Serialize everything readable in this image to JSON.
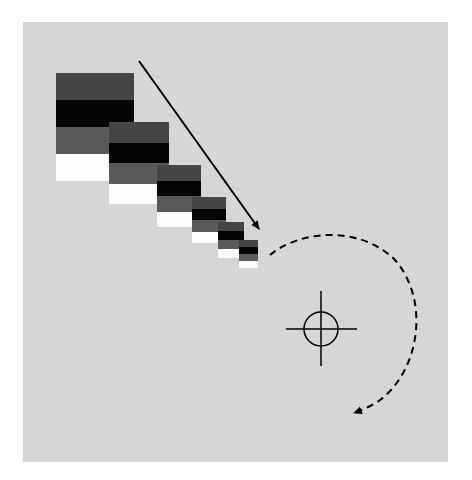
{
  "diagram": {
    "background": {
      "x": 23,
      "y": 22,
      "w": 425,
      "h": 440,
      "color": "#d6d6d6"
    },
    "band_colors": [
      "#454545",
      "#050505",
      "#5a5a5a",
      "#fdfdfd"
    ],
    "swatch_blocks": [
      {
        "x": 56,
        "y": 73,
        "w": 78,
        "h": 108
      },
      {
        "x": 109,
        "y": 122,
        "w": 60,
        "h": 82
      },
      {
        "x": 157,
        "y": 165,
        "w": 44,
        "h": 62
      },
      {
        "x": 192,
        "y": 197,
        "w": 34,
        "h": 46
      },
      {
        "x": 218,
        "y": 222,
        "w": 26,
        "h": 36
      },
      {
        "x": 239,
        "y": 240,
        "w": 19,
        "h": 28
      }
    ],
    "straight_arrow": {
      "x1": 139,
      "y1": 61,
      "x2": 259,
      "y2": 229,
      "color": "#000000"
    },
    "dashed_arc_arrow": {
      "path": "M 270 255 C 300 230, 360 225, 395 260 C 430 300, 420 370, 380 400 C 372 406, 362 410, 354 413",
      "tip": {
        "x": 352,
        "y": 413
      },
      "color": "#000000"
    },
    "crosshair": {
      "cx": 321,
      "cy": 329,
      "r": 17,
      "h_from": 286,
      "h_to": 357,
      "v_from": 291,
      "v_to": 366,
      "color": "#000000"
    }
  }
}
